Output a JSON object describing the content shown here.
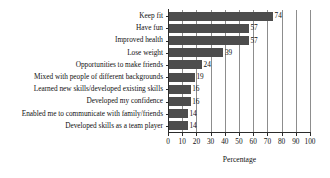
{
  "chart_data": {
    "type": "bar",
    "orientation": "horizontal",
    "title": "",
    "xlabel": "Percentage",
    "ylabel": "",
    "xlim": [
      0,
      100
    ],
    "xticks": [
      0,
      10,
      20,
      30,
      40,
      50,
      60,
      70,
      80,
      90,
      100
    ],
    "xtick_labels": [
      "0",
      "10",
      "20",
      "30",
      "40",
      "50",
      "60",
      "70",
      "80",
      "90",
      "100"
    ],
    "grid": "vertical",
    "legend": "none",
    "bar_color": "#4d4d4d",
    "gridline_color": "#8d8d8d",
    "axis_color": "#2b2b2b",
    "categories": [
      "Keep fit",
      "Have fun",
      "Improved health",
      "Lose weight",
      "Opportunities to make friends",
      "Mixed with people of different backgrounds",
      "Learned new skills/developed existing skills",
      "Developed my confidence",
      "Enabled me to communicate with family/friends",
      "Developed skills as a team player"
    ],
    "values": [
      74,
      57,
      57,
      39,
      24,
      19,
      16,
      16,
      14,
      14
    ],
    "value_labels": [
      "74",
      "57",
      "57",
      "39",
      "24",
      "19",
      "16",
      "16",
      "14",
      "14"
    ]
  }
}
